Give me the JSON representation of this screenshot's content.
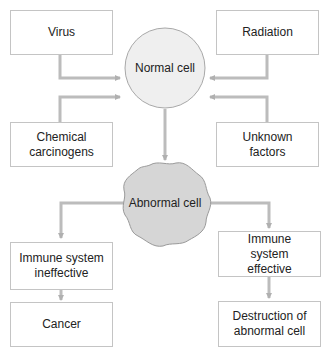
{
  "diagram": {
    "type": "flowchart",
    "colors": {
      "box_border": "#c4c4c4",
      "arrow": "#b9b9b9",
      "normal_cell_fill": "#efefef",
      "abnormal_cell_fill": "#d6d6d6",
      "text": "#222222"
    },
    "causes": [
      {
        "id": "virus",
        "label": "Virus"
      },
      {
        "id": "radiation",
        "label": "Radiation"
      },
      {
        "id": "chemical",
        "label": "Chemical carcinogens"
      },
      {
        "id": "unknown",
        "label": "Unknown factors"
      }
    ],
    "normal_cell": {
      "label": "Normal cell"
    },
    "abnormal_cell": {
      "label": "Abnormal cell"
    },
    "outcomes": [
      {
        "id": "ineffective",
        "label": "Immune system ineffective"
      },
      {
        "id": "cancer",
        "label": "Cancer"
      },
      {
        "id": "effective",
        "label": "Immune system effective"
      },
      {
        "id": "destruction",
        "label": "Destruction of abnormal cell"
      }
    ]
  }
}
